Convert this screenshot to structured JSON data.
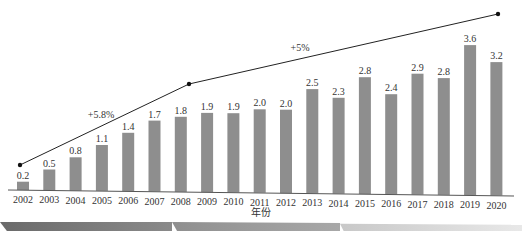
{
  "chart_data": {
    "type": "bar",
    "title": "",
    "xlabel": "年份",
    "ylabel": "",
    "categories": [
      "2002",
      "2003",
      "2004",
      "2005",
      "2006",
      "2007",
      "2008",
      "2009",
      "2010",
      "2011",
      "2012",
      "2013",
      "2014",
      "2015",
      "2016",
      "2017",
      "2018",
      "2019",
      "2020"
    ],
    "values": [
      0.2,
      0.5,
      0.8,
      1.1,
      1.4,
      1.7,
      1.8,
      1.9,
      1.9,
      2.0,
      2.0,
      2.5,
      2.3,
      2.8,
      2.4,
      2.9,
      2.8,
      3.6,
      3.2
    ],
    "value_labels": [
      "0.2",
      "0.5",
      "0.8",
      "1.1",
      "1.4",
      "1.7",
      "1.8",
      "1.9",
      "1.9",
      "2.0",
      "2.0",
      "2.5",
      "2.3",
      "2.8",
      "2.4",
      "2.9",
      "2.8",
      "3.6",
      "3.2"
    ],
    "ylim": [
      0,
      4
    ],
    "grid": false,
    "legend": null,
    "bar_color": "#8e8e8e",
    "trend_lines": [
      {
        "from": "2002",
        "to": "2008",
        "label": "+5.8%"
      },
      {
        "from": "2008",
        "to": "2020",
        "label": "+5%"
      }
    ],
    "annotations": [
      "+5.8%",
      "+5%"
    ]
  }
}
